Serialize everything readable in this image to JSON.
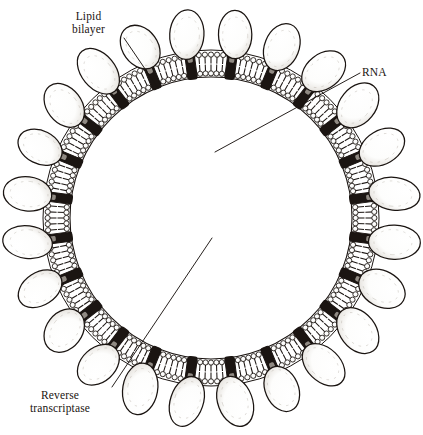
{
  "figure": {
    "background_color": "#ffffff",
    "ink_color": "#1a1411",
    "style": "black-and-white stippled line engraving"
  },
  "labels": [
    {
      "id": "lipid-bilayer",
      "text": "Lipid\nbilayer",
      "position": "top-left",
      "leader_from": [
        124,
        38
      ],
      "leader_to": [
        158,
        88
      ]
    },
    {
      "id": "rna",
      "text": "RNA",
      "position": "upper-right",
      "leader_from": [
        360,
        73
      ],
      "leader_to": [
        215,
        152
      ]
    },
    {
      "id": "reverse-transcriptase",
      "text": "Reverse\ntranscriptase",
      "position": "bottom-left",
      "leader_from": [
        112,
        387
      ],
      "leader_to": [
        212,
        238
      ]
    }
  ],
  "structures": {
    "envelope_spikes": {
      "name": "glycoprotein-spike",
      "count": 24,
      "shape": "ellipse-knob-on-stalk",
      "ellipse_rx": 25,
      "ellipse_ry": 17,
      "orbit_radius": 185,
      "stalk_length": 14
    },
    "lipid_bilayer": {
      "name": "lipid-bilayer",
      "outer_radius": 166,
      "inner_radius": 142,
      "phospholipid_count": 168,
      "transmembrane_protein_count": 24
    },
    "matrix_layer": {
      "name": "matrix-protein-layer",
      "outer_radius": 138,
      "inner_radius": 74,
      "ring_count": 9,
      "bead_radius": 5.0
    },
    "capsid": {
      "name": "capsid-core",
      "shape": "cone",
      "bead_radius": 9.0,
      "bead_count": 42,
      "fill": "dark-granular"
    },
    "nucleic_acid": {
      "name": "rna-strand",
      "strand_count": 2,
      "description": "two coiled RNA strands inside capsid"
    },
    "reverse_transcriptase_enzymes": {
      "name": "reverse-transcriptase-enzyme",
      "count": 2,
      "positions": [
        [
          208,
          234
        ],
        [
          224,
          261
        ]
      ],
      "radius": 5
    }
  },
  "chart_data": {
    "type": "diagram",
    "annotations": [
      "Lipid bilayer",
      "RNA",
      "Reverse transcriptase"
    ]
  }
}
